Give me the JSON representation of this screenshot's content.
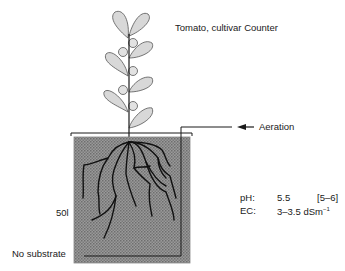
{
  "title": "Tomato, cultivar Counter",
  "labels": {
    "aeration": "Aeration",
    "volume": "50l",
    "substrate": "No substrate"
  },
  "parameters": {
    "ph": {
      "key": "pH:",
      "value": "5.5",
      "range": "[5–6]"
    },
    "ec": {
      "key": "EC:",
      "value": "3–3.5 dSm",
      "unit_exponent": "−1"
    }
  },
  "colors": {
    "leaf_fill": "#d6d6d6",
    "solution_fill": "#8a8a8a",
    "line": "#1a1a1a"
  },
  "icons": {
    "aeration_arrow": "arrow-left-icon"
  }
}
